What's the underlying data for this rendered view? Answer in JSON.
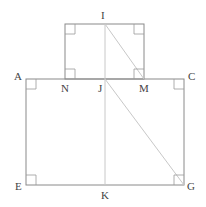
{
  "diagram": {
    "type": "geometry",
    "colors": {
      "edge": "#8a8a8a",
      "aux": "#c8c8c8",
      "label": "#444444"
    },
    "points": {
      "I": {
        "label": "I",
        "x": 105,
        "y": 24
      },
      "N": {
        "label": "N",
        "x": 65,
        "y": 79
      },
      "J": {
        "label": "J",
        "x": 105,
        "y": 79
      },
      "M": {
        "label": "M",
        "x": 144,
        "y": 79
      },
      "A": {
        "label": "A",
        "x": 26,
        "y": 79
      },
      "C": {
        "label": "C",
        "x": 184,
        "y": 79
      },
      "E": {
        "label": "E",
        "x": 26,
        "y": 185
      },
      "K": {
        "label": "K",
        "x": 105,
        "y": 185
      },
      "G": {
        "label": "G",
        "x": 184,
        "y": 185
      }
    },
    "labels": [
      {
        "id": "I",
        "text": "I"
      },
      {
        "id": "A",
        "text": "A"
      },
      {
        "id": "N",
        "text": "N"
      },
      {
        "id": "J",
        "text": "J"
      },
      {
        "id": "M",
        "text": "M"
      },
      {
        "id": "C",
        "text": "C"
      },
      {
        "id": "E",
        "text": "E"
      },
      {
        "id": "K",
        "text": "K"
      },
      {
        "id": "G",
        "text": "G"
      }
    ],
    "shapes": [
      {
        "name": "small-rectangle",
        "corners": [
          "N",
          "top-left",
          "top-right",
          "M"
        ]
      },
      {
        "name": "large-rectangle",
        "corners": [
          "A",
          "C",
          "G",
          "E"
        ]
      }
    ],
    "segments": [
      {
        "from": "I",
        "to": "K",
        "style": "auxiliary"
      },
      {
        "from": "I",
        "to": "M",
        "style": "auxiliary"
      },
      {
        "from": "J",
        "to": "G",
        "style": "auxiliary"
      }
    ],
    "right_angle_marks": [
      "small-top-left",
      "small-top-right",
      "N",
      "M",
      "A",
      "C",
      "E",
      "G"
    ]
  }
}
